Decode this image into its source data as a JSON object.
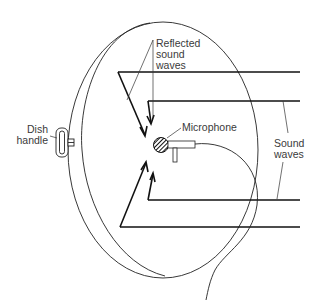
{
  "diagram": {
    "type": "parabolic-microphone-illustration",
    "labels": {
      "reflected": "Reflected\nsound\nwaves",
      "microphone": "Microphone",
      "dish_handle": "Dish\nhandle",
      "sound_waves": "Sound\nwaves"
    },
    "components": [
      "dish",
      "dish-rim",
      "dish-handle",
      "microphone",
      "microphone-cable",
      "incoming-sound-waves",
      "reflected-sound-waves"
    ],
    "colors": {
      "line": "#111111",
      "text": "#3a3a3a",
      "background": "#ffffff"
    }
  }
}
